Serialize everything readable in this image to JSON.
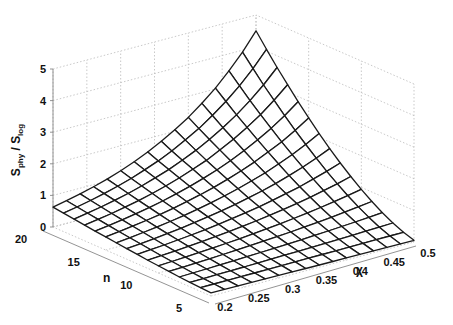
{
  "chart_data": {
    "type": "surface3d",
    "title": "",
    "xlabel": "χ",
    "ylabel": "n",
    "zlabel": "S_phy / S_log",
    "zlabel_main": "S",
    "zlabel_sub1": "phy",
    "zlabel_mid": " / S",
    "zlabel_sub2": "log",
    "x_ticks": [
      "0.2",
      "0.25",
      "0.3",
      "0.35",
      "0.4",
      "0.45",
      "0.5"
    ],
    "y_ticks": [
      "5",
      "10",
      "15",
      "20"
    ],
    "z_ticks": [
      "0",
      "1",
      "2",
      "3",
      "4",
      "5"
    ],
    "xlim": [
      0.2,
      0.5
    ],
    "ylim": [
      5,
      20
    ],
    "zlim": [
      0,
      5
    ],
    "grid": true,
    "x": [
      0.2,
      0.22,
      0.24,
      0.26,
      0.28,
      0.3,
      0.32,
      0.34,
      0.36,
      0.38,
      0.4,
      0.42,
      0.44,
      0.46,
      0.48,
      0.5
    ],
    "y": [
      5,
      6,
      7,
      8,
      9,
      10,
      11,
      12,
      13,
      14,
      15,
      16,
      17,
      18,
      19,
      20
    ],
    "z": [
      [
        0.1,
        0.096,
        0.092,
        0.088,
        0.084,
        0.081,
        0.078,
        0.074,
        0.071,
        0.068,
        0.066,
        0.063,
        0.06,
        0.058,
        0.055,
        0.053
      ],
      [
        0.116,
        0.119,
        0.121,
        0.124,
        0.127,
        0.129,
        0.132,
        0.135,
        0.138,
        0.141,
        0.144,
        0.148,
        0.151,
        0.154,
        0.158,
        0.161
      ],
      [
        0.139,
        0.147,
        0.155,
        0.163,
        0.172,
        0.181,
        0.191,
        0.201,
        0.212,
        0.224,
        0.236,
        0.249,
        0.262,
        0.277,
        0.292,
        0.309
      ],
      [
        0.165,
        0.177,
        0.191,
        0.205,
        0.221,
        0.237,
        0.255,
        0.274,
        0.295,
        0.317,
        0.341,
        0.367,
        0.394,
        0.424,
        0.456,
        0.49
      ],
      [
        0.195,
        0.212,
        0.231,
        0.252,
        0.274,
        0.298,
        0.325,
        0.353,
        0.385,
        0.419,
        0.456,
        0.496,
        0.54,
        0.588,
        0.641,
        0.699
      ],
      [
        0.227,
        0.249,
        0.274,
        0.301,
        0.331,
        0.364,
        0.4,
        0.44,
        0.483,
        0.531,
        0.584,
        0.642,
        0.705,
        0.775,
        0.852,
        0.937
      ],
      [
        0.261,
        0.289,
        0.32,
        0.354,
        0.392,
        0.434,
        0.48,
        0.531,
        0.588,
        0.651,
        0.721,
        0.798,
        0.883,
        0.978,
        1.08,
        1.2
      ],
      [
        0.297,
        0.331,
        0.368,
        0.41,
        0.456,
        0.507,
        0.565,
        0.629,
        0.7,
        0.779,
        0.867,
        0.965,
        1.07,
        1.2,
        1.33,
        1.48
      ],
      [
        0.334,
        0.374,
        0.418,
        0.467,
        0.523,
        0.585,
        0.654,
        0.731,
        0.818,
        0.915,
        1.02,
        1.14,
        1.28,
        1.43,
        1.6,
        1.79
      ],
      [
        0.373,
        0.419,
        0.47,
        0.528,
        0.593,
        0.666,
        0.748,
        0.839,
        0.942,
        1.06,
        1.19,
        1.33,
        1.5,
        1.68,
        1.89,
        2.12
      ],
      [
        0.413,
        0.465,
        0.524,
        0.591,
        0.665,
        0.75,
        0.845,
        0.952,
        1.07,
        1.21,
        1.36,
        1.53,
        1.73,
        1.94,
        2.19,
        2.47
      ],
      [
        0.454,
        0.513,
        0.58,
        0.655,
        0.74,
        0.837,
        0.945,
        1.07,
        1.21,
        1.36,
        1.54,
        1.74,
        1.97,
        2.22,
        2.51,
        2.84
      ],
      [
        0.496,
        0.562,
        0.637,
        0.721,
        0.817,
        0.926,
        1.05,
        1.19,
        1.35,
        1.52,
        1.73,
        1.96,
        2.22,
        2.51,
        2.85,
        3.23
      ],
      [
        0.54,
        0.613,
        0.696,
        0.79,
        0.897,
        1.02,
        1.16,
        1.31,
        1.49,
        1.69,
        1.92,
        2.18,
        2.47,
        2.81,
        3.19,
        3.63
      ],
      [
        0.585,
        0.666,
        0.757,
        0.861,
        0.98,
        1.11,
        1.27,
        1.44,
        1.64,
        1.87,
        2.12,
        2.42,
        2.75,
        3.13,
        3.56,
        4.06
      ],
      [
        0.63,
        0.718,
        0.819,
        0.933,
        1.06,
        1.21,
        1.38,
        1.58,
        1.8,
        2.05,
        2.33,
        2.66,
        3.03,
        3.46,
        3.94,
        4.5
      ]
    ],
    "view": {
      "origin_px": [
        53,
        227
      ],
      "n_dir_px": [
        158,
        69
      ],
      "chi_dir_px": [
        203,
        -54
      ],
      "z_px_per_unit": 31.6
    }
  }
}
